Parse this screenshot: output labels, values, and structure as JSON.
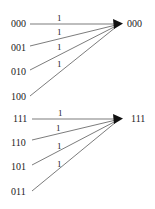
{
  "groups": [
    {
      "target": "000",
      "sources": [
        "000",
        "001",
        "010",
        "100"
      ],
      "weights": [
        "1",
        "1",
        "1",
        "1"
      ]
    },
    {
      "target": "111",
      "sources": [
        "111",
        "110",
        "101",
        "011"
      ],
      "weights": [
        "1",
        "1",
        "1",
        "1"
      ]
    }
  ],
  "colors": {
    "line": "#444444",
    "text": "#222222"
  }
}
